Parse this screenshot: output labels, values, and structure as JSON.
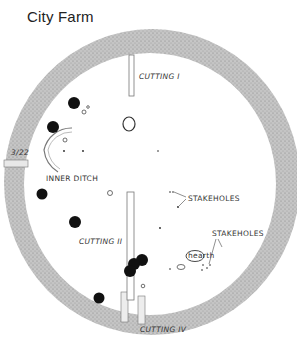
{
  "title": "City Farm",
  "labels": {
    "cutting_1": "CUTTING I",
    "cutting_2": "CUTTING II",
    "cutting_4": "CUTTING IV",
    "inner_ditch": "INNER DITCH",
    "stakeholes_1": "STAKEHOLES",
    "stakeholes_2": "STAKEHOLES",
    "ditch_section": "3/22",
    "oval_feature": "hearth"
  },
  "colors": {
    "ditch_fill": "#bdbdbd",
    "pit_fill": "#111111",
    "background": "#ffffff"
  }
}
